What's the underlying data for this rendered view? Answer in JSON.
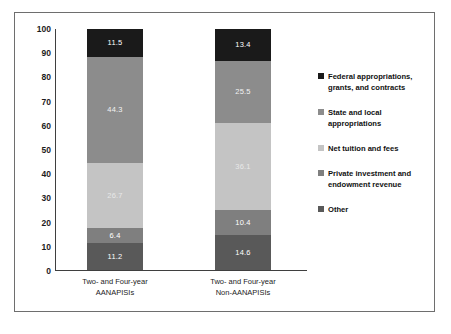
{
  "chart_data": {
    "type": "bar",
    "subtype": "stacked-100-percent",
    "title": "",
    "subtitle": "",
    "xlabel": "",
    "ylabel": "",
    "ylim": [
      0,
      100
    ],
    "yticks": [
      0,
      10,
      20,
      30,
      40,
      50,
      60,
      70,
      80,
      90,
      100
    ],
    "ytick_labels": [
      "0",
      "10",
      "20",
      "30",
      "40",
      "50",
      "60",
      "70",
      "80",
      "90",
      "100"
    ],
    "grid": false,
    "legend_position": "right",
    "categories": [
      "Two- and Four-year AANAPISIs",
      "Two- and Four-year Non-AANAPISIs"
    ],
    "category_lines": [
      [
        "Two- and Four-year",
        "AANAPISIs"
      ],
      [
        "Two- and Four-year",
        "Non-AANAPISIs"
      ]
    ],
    "series": [
      {
        "name": "Other",
        "color": "#595959",
        "text_color": "#ffffff",
        "values": [
          11.2,
          14.6
        ],
        "labels": [
          "11.2",
          "14.6"
        ]
      },
      {
        "name": "Private investment and endowment revenue",
        "color": "#7f7f7f",
        "text_color": "#ffffff",
        "values": [
          6.4,
          10.4
        ],
        "labels": [
          "6.4",
          "10.4"
        ]
      },
      {
        "name": "Net tuition and fees",
        "color": "#c4c4c4",
        "text_color": "#e8e8e8",
        "values": [
          26.7,
          36.1
        ],
        "labels": [
          "26.7",
          "36.1"
        ]
      },
      {
        "name": "State and local appropriations",
        "color": "#8c8c8c",
        "text_color": "#f2f2f2",
        "values": [
          44.3,
          25.5
        ],
        "labels": [
          "44.3",
          "25.5"
        ]
      },
      {
        "name": "Federal appropriations, grants, and contracts",
        "color": "#1a1a1a",
        "text_color": "#ffffff",
        "values": [
          11.5,
          13.4
        ],
        "labels": [
          "11.5",
          "13.4"
        ]
      }
    ],
    "legend_entries": [
      {
        "label_lines": [
          "Federal appropriations,",
          "grants, and contracts"
        ],
        "color": "#1a1a1a"
      },
      {
        "label_lines": [
          "State and local appropriations"
        ],
        "color": "#8c8c8c"
      },
      {
        "label_lines": [
          "Net tuition and fees"
        ],
        "color": "#c4c4c4"
      },
      {
        "label_lines": [
          "Private investment and",
          "endowment revenue"
        ],
        "color": "#7f7f7f"
      },
      {
        "label_lines": [
          "Other"
        ],
        "color": "#595959"
      }
    ]
  }
}
